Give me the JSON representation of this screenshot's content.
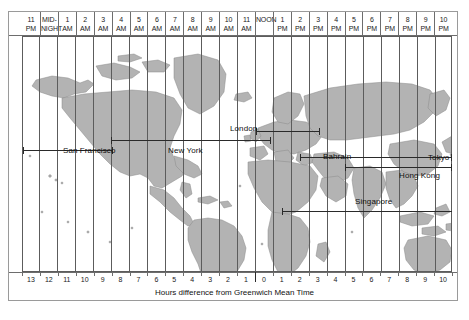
{
  "figure": {
    "type": "world-time-zone-map",
    "caption": "Hours difference from Greenwich Mean Time",
    "land_color": "#b3b3b3",
    "ocean_color": "#ffffff",
    "grid_color": "#5c5c5c"
  },
  "top_axis": {
    "label": "Local time of day",
    "ticks": [
      {
        "line1": "11",
        "line2": "PM"
      },
      {
        "line1": "MID-",
        "line2": "NIGHT"
      },
      {
        "line1": "1",
        "line2": "AM"
      },
      {
        "line1": "2",
        "line2": "AM"
      },
      {
        "line1": "3",
        "line2": "AM"
      },
      {
        "line1": "4",
        "line2": "AM"
      },
      {
        "line1": "5",
        "line2": "AM"
      },
      {
        "line1": "6",
        "line2": "AM"
      },
      {
        "line1": "7",
        "line2": "AM"
      },
      {
        "line1": "8",
        "line2": "AM"
      },
      {
        "line1": "9",
        "line2": "AM"
      },
      {
        "line1": "10",
        "line2": "AM"
      },
      {
        "line1": "11",
        "line2": "AM"
      },
      {
        "line1": "NOON",
        "line2": ""
      },
      {
        "line1": "1",
        "line2": "PM"
      },
      {
        "line1": "2",
        "line2": "PM"
      },
      {
        "line1": "3",
        "line2": "PM"
      },
      {
        "line1": "4",
        "line2": "PM"
      },
      {
        "line1": "5",
        "line2": "PM"
      },
      {
        "line1": "6",
        "line2": "PM"
      },
      {
        "line1": "7",
        "line2": "PM"
      },
      {
        "line1": "8",
        "line2": "PM"
      },
      {
        "line1": "9",
        "line2": "PM"
      },
      {
        "line1": "10",
        "line2": "PM"
      }
    ]
  },
  "bottom_axis": {
    "label": "Hours difference from Greenwich Mean Time",
    "ticks": [
      "13",
      "12",
      "11",
      "10",
      "9",
      "8",
      "7",
      "6",
      "5",
      "4",
      "3",
      "2",
      "1",
      "0",
      "1",
      "2",
      "3",
      "4",
      "5",
      "6",
      "7",
      "8",
      "9",
      "10"
    ],
    "zero_index": 13
  },
  "cities": [
    {
      "name": "San Francisco",
      "label_x": 63,
      "label_y": 146
    },
    {
      "name": "New York",
      "label_x": 168,
      "label_y": 146
    },
    {
      "name": "London",
      "label_x": 230,
      "label_y": 124
    },
    {
      "name": "Bahrain",
      "label_x": 323,
      "label_y": 152
    },
    {
      "name": "Tokyo",
      "label_x": 428,
      "label_y": 153
    },
    {
      "name": "Hong Kong",
      "label_x": 399,
      "label_y": 171
    },
    {
      "name": "Singapore",
      "label_x": 355,
      "label_y": 197
    }
  ],
  "chart_data": {
    "type": "table",
    "title": "Hours difference from Greenwich Mean Time",
    "xlabel": "Hours difference from Greenwich Mean Time",
    "ylabel": "",
    "categories": [
      "San Francisco",
      "New York",
      "London",
      "Bahrain",
      "Singapore",
      "Hong Kong",
      "Tokyo"
    ],
    "series": [
      {
        "name": "GMT offset (hours)",
        "values": [
          -8,
          -5,
          0,
          3,
          8,
          8,
          9
        ]
      }
    ],
    "x": [
      "13",
      "12",
      "11",
      "10",
      "9",
      "8",
      "7",
      "6",
      "5",
      "4",
      "3",
      "2",
      "1",
      "0",
      "1",
      "2",
      "3",
      "4",
      "5",
      "6",
      "7",
      "8",
      "9",
      "10"
    ],
    "top_tick_labels": [
      "11 PM",
      "MIDNIGHT",
      "1 AM",
      "2 AM",
      "3 AM",
      "4 AM",
      "5 AM",
      "6 AM",
      "7 AM",
      "8 AM",
      "9 AM",
      "10 AM",
      "11 AM",
      "NOON",
      "1 PM",
      "2 PM",
      "3 PM",
      "4 PM",
      "5 PM",
      "6 PM",
      "7 PM",
      "8 PM",
      "9 PM",
      "10 PM"
    ],
    "grid": true,
    "legend": "none"
  }
}
